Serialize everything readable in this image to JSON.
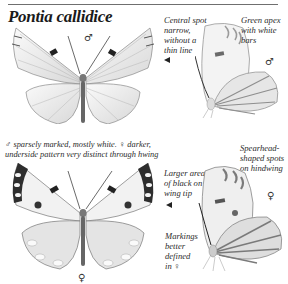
{
  "title": "Pontia callidice",
  "annotations": {
    "central_spot": "Central spot\nnarrow,\nwithout a\nthin line",
    "green_apex": "Green apex\nwith white\nbars",
    "caption": "♂ sparsely marked, mostly white. ♀ darker,\nunderside pattern very distinct through hwing",
    "spearhead": "Spearhead-\nshaped spots\non hindwing",
    "larger_black": "Larger area\nof black on\nwing tip",
    "markings_better": "Markings\nbetter\ndefined\nin ♀"
  },
  "symbols": {
    "male_upperside": "♂",
    "male_underside": "♂",
    "female_upperside": "♀",
    "female_underside": "♀"
  },
  "figures": [
    {
      "id": "male-upperside",
      "sex": "male",
      "view": "upperside"
    },
    {
      "id": "male-underside",
      "sex": "male",
      "view": "underside"
    },
    {
      "id": "female-upperside",
      "sex": "female",
      "view": "upperside"
    },
    {
      "id": "female-underside",
      "sex": "female",
      "view": "underside"
    }
  ],
  "colors": {
    "rule": "#6f6f6f",
    "wing_fill": "#f4f4f4",
    "vein": "#9a9a9a",
    "dark_marking": "#2e2e2e"
  }
}
